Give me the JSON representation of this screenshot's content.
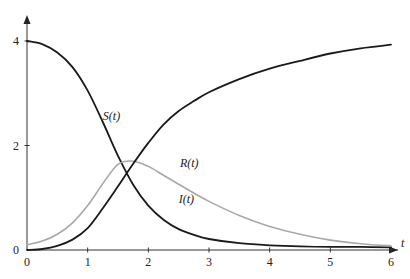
{
  "chart_data": {
    "type": "line",
    "title": "",
    "xlabel": "t",
    "ylabel": "",
    "xlim": [
      0,
      6
    ],
    "ylim": [
      0,
      4
    ],
    "grid": false,
    "legend": "none (inline curve labels)",
    "x_ticks": [
      0,
      1,
      2,
      3,
      4,
      5,
      6
    ],
    "x_tick_labels": [
      "0",
      "1",
      "2",
      "3",
      "4",
      "5",
      "6"
    ],
    "y_ticks": [
      0,
      2,
      4
    ],
    "y_tick_labels": [
      "0",
      "2",
      "4"
    ],
    "x": [
      0,
      0.25,
      0.5,
      0.75,
      1.0,
      1.25,
      1.5,
      1.75,
      2.0,
      2.25,
      2.5,
      2.75,
      3.0,
      3.5,
      4.0,
      4.5,
      5.0,
      5.5,
      6.0
    ],
    "series": [
      {
        "name": "S(t)",
        "label": "S(t)",
        "color": "#1a1a1a",
        "values": [
          4.0,
          3.94,
          3.78,
          3.5,
          3.05,
          2.45,
          1.8,
          1.25,
          0.85,
          0.58,
          0.4,
          0.29,
          0.21,
          0.13,
          0.09,
          0.07,
          0.06,
          0.06,
          0.05
        ]
      },
      {
        "name": "I(t)",
        "label": "I(t)",
        "color": "#a8a8a8",
        "values": [
          0.1,
          0.17,
          0.3,
          0.52,
          0.85,
          1.27,
          1.64,
          1.7,
          1.6,
          1.43,
          1.26,
          1.09,
          0.93,
          0.66,
          0.45,
          0.3,
          0.19,
          0.12,
          0.08
        ]
      },
      {
        "name": "R(t)",
        "label": "R(t)",
        "color": "#1a1a1a",
        "values": [
          0.0,
          0.02,
          0.08,
          0.2,
          0.42,
          0.8,
          1.22,
          1.65,
          2.05,
          2.4,
          2.66,
          2.85,
          3.02,
          3.27,
          3.47,
          3.62,
          3.76,
          3.86,
          3.93
        ]
      }
    ],
    "annotations": [
      {
        "text": "S(t)",
        "x": 1.25,
        "y": 2.48
      },
      {
        "text": "R(t)",
        "x": 2.52,
        "y": 1.58
      },
      {
        "text": "I(t)",
        "x": 2.5,
        "y": 0.9
      }
    ]
  }
}
